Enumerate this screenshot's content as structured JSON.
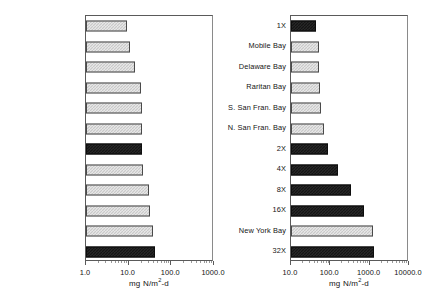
{
  "chart_data": [
    {
      "id": "left",
      "type": "bar",
      "orientation": "horizontal",
      "title": "",
      "xlabel": "mg N/m2-d",
      "xlabel_parts": {
        "pre": "mg N/m",
        "sup": "2",
        "post": "-d"
      },
      "ylabel": "",
      "xscale": "log",
      "xlim": [
        1.0,
        1000.0
      ],
      "grid": false,
      "legend": "none",
      "xticks": [
        1.0,
        10.0,
        100.0,
        1000.0
      ],
      "xticklabels": [
        "1.0",
        "10.0",
        "100.0",
        "1000.0"
      ],
      "categories": [
        "Kaneohe Bay",
        "Massachusetts Bay",
        "Long Island Sound",
        "Chesapeake Bay",
        "Apalachicola Bay",
        "Barataria Bay",
        "0X",
        "Patuxent Estuary",
        "Potomac Estuary",
        "Pamlico",
        "Narragansett Bay",
        "1X"
      ],
      "values": [
        9.0,
        11.0,
        14.0,
        19.0,
        20.0,
        20.0,
        21.0,
        22.0,
        30.0,
        32.0,
        38.0,
        42.0
      ],
      "series_kinds": [
        "light",
        "light",
        "light",
        "light",
        "light",
        "light",
        "dark",
        "light",
        "light",
        "light",
        "light",
        "dark"
      ]
    },
    {
      "id": "right",
      "type": "bar",
      "orientation": "horizontal",
      "title": "",
      "xlabel": "mg N/m2-d",
      "xlabel_parts": {
        "pre": "mg N/m",
        "sup": "2",
        "post": "-d"
      },
      "ylabel": "",
      "xscale": "log",
      "xlim": [
        10.0,
        10000.0
      ],
      "grid": false,
      "legend": "none",
      "xticks": [
        10.0,
        100.0,
        1000.0,
        10000.0
      ],
      "xticklabels": [
        "10.0",
        "100.0",
        "1000.0",
        "10000.0"
      ],
      "categories": [
        "1X",
        "Mobile Bay",
        "Delaware Bay",
        "Raritan Bay",
        "S. San Fran. Bay",
        "N. San Fran. Bay",
        "2X",
        "4X",
        "8X",
        "16X",
        "New York Bay",
        "32X"
      ],
      "values": [
        42.0,
        52.0,
        52.0,
        55.0,
        58.0,
        68.0,
        85.0,
        160.0,
        330.0,
        700.0,
        1250.0,
        1300.0
      ],
      "series_kinds": [
        "dark",
        "light",
        "light",
        "light",
        "light",
        "light",
        "dark",
        "dark",
        "dark",
        "dark",
        "light",
        "dark"
      ]
    }
  ]
}
